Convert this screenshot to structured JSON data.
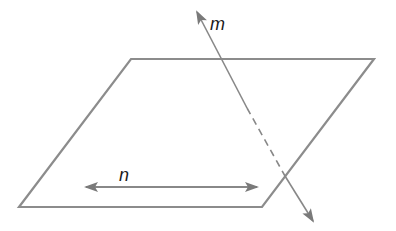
{
  "figure": {
    "type": "geometry-diagram",
    "colors": {
      "plane_stroke": "#8c8c8c",
      "line_stroke": "#888888",
      "arrowhead": "#7a7a7a",
      "label": "#1a1a1a",
      "background": "#ffffff"
    },
    "plane": {
      "name": "plane",
      "vertices": [
        [
          131,
          59
        ],
        [
          374,
          59
        ],
        [
          262,
          207
        ],
        [
          19,
          207
        ]
      ]
    },
    "lines": [
      {
        "id": "m",
        "label": "m",
        "start": [
          197,
          12
        ],
        "end": [
          313,
          221
        ],
        "hidden_segment": {
          "from": [
            247,
            108
          ],
          "to": [
            285,
            176
          ]
        },
        "arrows": "both",
        "label_pos": [
          211,
          30
        ]
      },
      {
        "id": "n",
        "label": "n",
        "start": [
          86,
          187
        ],
        "end": [
          257,
          187
        ],
        "arrows": "both",
        "label_pos": [
          120,
          181
        ]
      }
    ]
  },
  "labels": {
    "m": "m",
    "n": "n"
  }
}
